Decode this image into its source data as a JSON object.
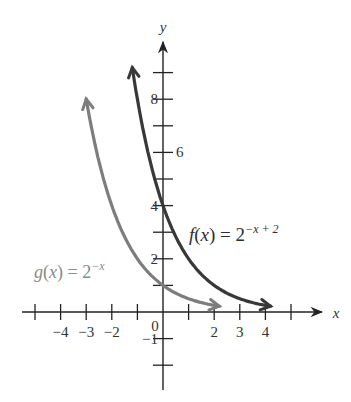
{
  "chart_data": {
    "type": "line",
    "title": "",
    "xlabel": "x",
    "ylabel": "y",
    "xlim": [
      -5.2,
      6.3
    ],
    "ylim": [
      -2.9,
      10.4
    ],
    "grid": false,
    "x_ticks": [
      -5,
      -4,
      -3,
      -2,
      -1,
      0,
      1,
      2,
      3,
      4,
      5
    ],
    "x_tick_labels": [
      {
        "value": -4,
        "label": "−4"
      },
      {
        "value": -3,
        "label": "−3"
      },
      {
        "value": -2,
        "label": "−2"
      },
      {
        "value": 2,
        "label": "2"
      },
      {
        "value": 3,
        "label": "3"
      },
      {
        "value": 4,
        "label": "4"
      }
    ],
    "y_ticks": [
      -2,
      -1,
      1,
      2,
      3,
      4,
      5,
      6,
      7,
      8,
      9
    ],
    "y_tick_labels": [
      {
        "value": -1,
        "label": "−1"
      },
      {
        "value": 2,
        "label": "2"
      },
      {
        "value": 4,
        "label": "4"
      },
      {
        "value": 6,
        "label": "6"
      },
      {
        "value": 8,
        "label": "8"
      }
    ],
    "origin_label": "0",
    "series": [
      {
        "name": "g(x) = 2^(−x)",
        "label_base": "g(x) = 2",
        "label_exp": "−x",
        "color": "#7d7d7d",
        "x_range": [
          -3.0,
          2.2
        ],
        "x": [
          -3,
          -2,
          -1,
          0,
          1,
          2
        ],
        "values": [
          8,
          4,
          2,
          1,
          0.5,
          0.25
        ]
      },
      {
        "name": "f(x) = 2^(−x + 2)",
        "label_base": "f(x) = 2",
        "label_exp": "−x + 2",
        "color": "#383838",
        "x_range": [
          -1.2,
          4.2
        ],
        "x": [
          -1,
          0,
          1,
          2,
          3,
          4
        ],
        "values": [
          8,
          4,
          2,
          1,
          0.5,
          0.25
        ]
      }
    ]
  },
  "colors": {
    "axis": "#222222"
  }
}
